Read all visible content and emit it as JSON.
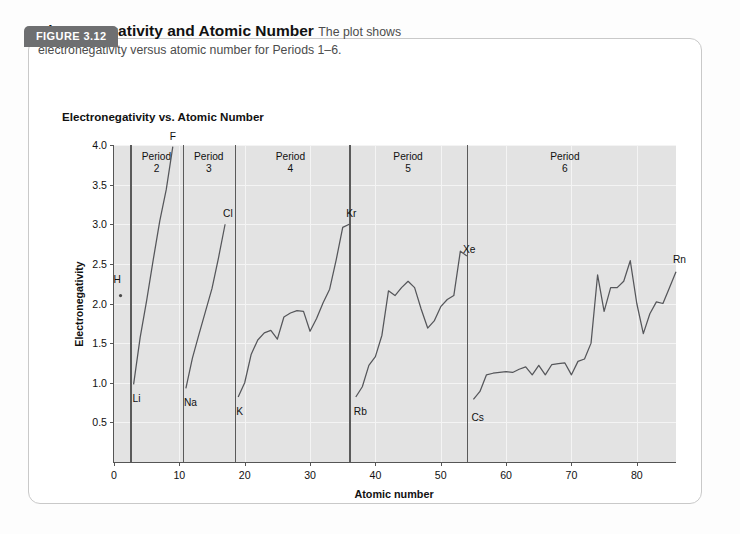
{
  "figure": {
    "tab_label": "FIGURE 3.12",
    "caption_title": "Electronegativity and Atomic Number",
    "caption_lead": "The plot shows",
    "caption_rest": "electronegativity versus atomic number for Periods 1–6."
  },
  "chart_data": {
    "type": "line",
    "title": "Electronegativity vs. Atomic Number",
    "xlabel": "Atomic number",
    "ylabel": "Electronegativity",
    "xlim": [
      0,
      86
    ],
    "ylim": [
      0,
      4.0
    ],
    "xticks": [
      0,
      10,
      20,
      30,
      40,
      50,
      60,
      70,
      80
    ],
    "yticks": [
      "0.5",
      "1.0",
      "1.5",
      "2.0",
      "2.5",
      "3.0",
      "3.5",
      "4.0"
    ],
    "grid": true,
    "legend": "none",
    "period_dividers": [
      2.5,
      10.5,
      18.5,
      36.0,
      54.0
    ],
    "period_labels": [
      {
        "text": "Period",
        "number": "2",
        "x": 6.5
      },
      {
        "text": "Period",
        "number": "3",
        "x": 14.5
      },
      {
        "text": "Period",
        "number": "4",
        "x": 27.0
      },
      {
        "text": "Period",
        "number": "5",
        "x": 45.0
      },
      {
        "text": "Period",
        "number": "6",
        "x": 69.0
      }
    ],
    "point_labels": [
      {
        "label": "H",
        "x": 1,
        "y": 2.1,
        "dx": -7,
        "dy": -22
      },
      {
        "label": "Li",
        "x": 3,
        "y": 0.98,
        "dx": -1,
        "dy": 9
      },
      {
        "label": "F",
        "x": 9,
        "y": 3.98,
        "dx": -3,
        "dy": -16
      },
      {
        "label": "Na",
        "x": 11,
        "y": 0.93,
        "dx": -2,
        "dy": 9
      },
      {
        "label": "Cl",
        "x": 17,
        "y": 3.0,
        "dx": -2,
        "dy": -16
      },
      {
        "label": "K",
        "x": 19,
        "y": 0.82,
        "dx": -2,
        "dy": 9
      },
      {
        "label": "Kr",
        "x": 36,
        "y": 3.0,
        "dx": -3,
        "dy": -16
      },
      {
        "label": "Rb",
        "x": 37,
        "y": 0.82,
        "dx": -2,
        "dy": 9
      },
      {
        "label": "Xe",
        "x": 54,
        "y": 2.55,
        "dx": -4,
        "dy": -16
      },
      {
        "label": "Cs",
        "x": 55,
        "y": 0.75,
        "dx": -2,
        "dy": 9
      },
      {
        "label": "Rn",
        "x": 86,
        "y": 2.42,
        "dx": -3,
        "dy": -16
      }
    ],
    "series": [
      {
        "name": "Period 1",
        "points": [
          [
            1,
            2.1
          ]
        ]
      },
      {
        "name": "Period 2",
        "points": [
          [
            3,
            0.98
          ],
          [
            4,
            1.57
          ],
          [
            5,
            2.04
          ],
          [
            6,
            2.55
          ],
          [
            7,
            3.04
          ],
          [
            8,
            3.44
          ],
          [
            9,
            3.98
          ]
        ]
      },
      {
        "name": "Period 3",
        "points": [
          [
            11,
            0.93
          ],
          [
            12,
            1.31
          ],
          [
            13,
            1.61
          ],
          [
            14,
            1.9
          ],
          [
            15,
            2.19
          ],
          [
            16,
            2.58
          ],
          [
            17,
            3.0
          ]
        ]
      },
      {
        "name": "Period 4",
        "points": [
          [
            19,
            0.82
          ],
          [
            20,
            1.0
          ],
          [
            21,
            1.36
          ],
          [
            22,
            1.54
          ],
          [
            23,
            1.63
          ],
          [
            24,
            1.66
          ],
          [
            25,
            1.55
          ],
          [
            26,
            1.83
          ],
          [
            27,
            1.88
          ],
          [
            28,
            1.91
          ],
          [
            29,
            1.9
          ],
          [
            30,
            1.65
          ],
          [
            31,
            1.81
          ],
          [
            32,
            2.01
          ],
          [
            33,
            2.18
          ],
          [
            34,
            2.55
          ],
          [
            35,
            2.96
          ],
          [
            36,
            3.0
          ]
        ]
      },
      {
        "name": "Period 5",
        "points": [
          [
            37,
            0.82
          ],
          [
            38,
            0.95
          ],
          [
            39,
            1.22
          ],
          [
            40,
            1.33
          ],
          [
            41,
            1.6
          ],
          [
            42,
            2.16
          ],
          [
            43,
            2.1
          ],
          [
            44,
            2.2
          ],
          [
            45,
            2.28
          ],
          [
            46,
            2.2
          ],
          [
            47,
            1.93
          ],
          [
            48,
            1.69
          ],
          [
            49,
            1.78
          ],
          [
            50,
            1.96
          ],
          [
            51,
            2.05
          ],
          [
            52,
            2.1
          ],
          [
            53,
            2.66
          ],
          [
            54,
            2.6
          ]
        ]
      },
      {
        "name": "Period 6",
        "points": [
          [
            55,
            0.79
          ],
          [
            56,
            0.89
          ],
          [
            57,
            1.1
          ],
          [
            58,
            1.12
          ],
          [
            59,
            1.13
          ],
          [
            60,
            1.14
          ],
          [
            61,
            1.13
          ],
          [
            62,
            1.17
          ],
          [
            63,
            1.2
          ],
          [
            64,
            1.1
          ],
          [
            65,
            1.22
          ],
          [
            66,
            1.1
          ],
          [
            67,
            1.23
          ],
          [
            68,
            1.24
          ],
          [
            69,
            1.25
          ],
          [
            70,
            1.1
          ],
          [
            71,
            1.27
          ],
          [
            72,
            1.3
          ],
          [
            73,
            1.5
          ],
          [
            74,
            2.36
          ],
          [
            75,
            1.9
          ],
          [
            76,
            2.2
          ],
          [
            77,
            2.2
          ],
          [
            78,
            2.28
          ],
          [
            79,
            2.54
          ],
          [
            80,
            2.0
          ],
          [
            81,
            1.62
          ],
          [
            82,
            1.87
          ],
          [
            83,
            2.02
          ],
          [
            84,
            2.0
          ],
          [
            85,
            2.2
          ],
          [
            86,
            2.4
          ]
        ]
      }
    ]
  }
}
